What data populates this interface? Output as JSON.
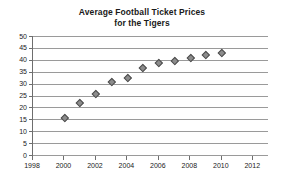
{
  "chart_data": {
    "type": "scatter",
    "title": "Average Football Ticket Prices for the Tigers",
    "title_lines": [
      "Average Football Ticket Prices",
      "for the Tigers"
    ],
    "xlabel": "",
    "ylabel": "",
    "xlim": [
      1998,
      2013
    ],
    "ylim": [
      0,
      50
    ],
    "x_tick_labels": [
      "1998",
      "2000",
      "2002",
      "2004",
      "2006",
      "2008",
      "2010",
      "2012"
    ],
    "x_ticks": [
      1998,
      2000,
      2002,
      2004,
      2006,
      2008,
      2010,
      2012
    ],
    "y_tick_labels": [
      "0",
      "5",
      "10",
      "15",
      "20",
      "25",
      "30",
      "35",
      "40",
      "45",
      "50"
    ],
    "y_ticks": [
      0,
      5,
      10,
      15,
      20,
      25,
      30,
      35,
      40,
      45,
      50
    ],
    "grid": "horizontal",
    "legend": "none",
    "marker": "diamond",
    "marker_color": "#8c8c8c",
    "marker_edge_color": "#4d4d4d",
    "gridline_color": "#9a9a9a",
    "axis_color": "#6e6e6e",
    "x": [
      2000,
      2001,
      2002,
      2003,
      2004,
      2005,
      2006,
      2007,
      2008,
      2009,
      2010
    ],
    "values": [
      16,
      22.5,
      26,
      31,
      32.7,
      37.2,
      39.3,
      40.2,
      41.3,
      42.7,
      43.4
    ],
    "points": [
      {
        "x": 2000,
        "y": 16
      },
      {
        "x": 2001,
        "y": 22.5
      },
      {
        "x": 2002,
        "y": 26
      },
      {
        "x": 2003,
        "y": 31
      },
      {
        "x": 2004,
        "y": 32.7
      },
      {
        "x": 2005,
        "y": 37.2
      },
      {
        "x": 2006,
        "y": 39.3
      },
      {
        "x": 2007,
        "y": 40.2
      },
      {
        "x": 2008,
        "y": 41.3
      },
      {
        "x": 2009,
        "y": 42.7
      },
      {
        "x": 2010,
        "y": 43.4
      }
    ]
  }
}
